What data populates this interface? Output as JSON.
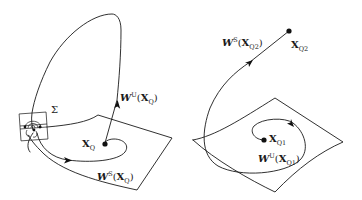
{
  "figure": {
    "colors": {
      "line": "#1a1a1a",
      "background": "#ffffff"
    },
    "left_panel": {
      "section_label": "Σ",
      "fixed_point": {
        "label_main": "X",
        "label_sub": "Q"
      },
      "unstable_manifold": {
        "label_W": "W",
        "label_sup": "U",
        "label_open": "(",
        "label_X": "X",
        "label_sub": "Q",
        "label_close": ")"
      },
      "stable_manifold": {
        "label_W": "W",
        "label_sup": "S",
        "label_open": "(",
        "label_X": "X",
        "label_sub": "Q",
        "label_close": ")"
      }
    },
    "right_panel": {
      "fixed_point_q2": {
        "label_main": "X",
        "label_sub": "Q2"
      },
      "fixed_point_q1": {
        "label_main": "X",
        "label_sub": "Q1"
      },
      "stable_manifold_q2": {
        "label_W": "W",
        "label_sup": "S",
        "label_open": "(",
        "label_X": "X",
        "label_sub": "Q2",
        "label_close": ")"
      },
      "unstable_manifold_q1": {
        "label_W": "W",
        "label_sup": "U",
        "label_open": "(",
        "label_X": "X",
        "label_sub": "Q1",
        "label_close": ")"
      }
    }
  }
}
